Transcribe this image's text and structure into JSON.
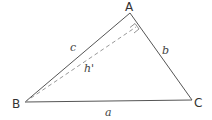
{
  "diagram": {
    "type": "triangle-with-altitude",
    "vertices": {
      "A": {
        "label": "A",
        "x": 130,
        "y": 13
      },
      "B": {
        "label": "B",
        "x": 25,
        "y": 102
      },
      "C": {
        "label": "C",
        "x": 192,
        "y": 100
      }
    },
    "sides": {
      "a": {
        "label": "a",
        "between": "B-C"
      },
      "b": {
        "label": "b",
        "between": "A-C"
      },
      "c": {
        "label": "c",
        "between": "A-B"
      }
    },
    "altitude": {
      "label": "h'",
      "from": "B",
      "foot_on": "AC",
      "style": "dashed"
    },
    "right_angle_marker": {
      "at": "foot of altitude on AC"
    },
    "colors": {
      "line": "#555555",
      "dashed": "#999999"
    }
  }
}
